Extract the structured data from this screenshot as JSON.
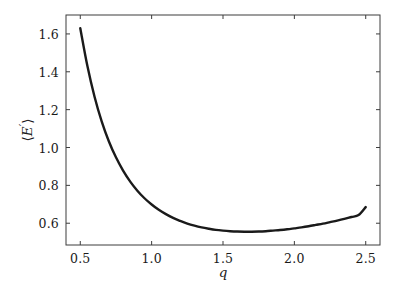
{
  "chart_data": {
    "type": "line",
    "title": "",
    "subtitle": "",
    "xlabel": "q",
    "ylabel": "⟨E′⟩",
    "ylabel_parts": {
      "open_bracket": "⟨",
      "symbol": "E",
      "prime": "′",
      "close_bracket": "⟩"
    },
    "xlim": [
      0.4,
      2.6
    ],
    "ylim": [
      0.485,
      1.7
    ],
    "xticks": [
      0.5,
      1.0,
      1.5,
      2.0,
      2.5
    ],
    "xtick_labels": [
      "0.5",
      "1.0",
      "1.5",
      "2.0",
      "2.5"
    ],
    "yticks": [
      0.6,
      0.8,
      1.0,
      1.2,
      1.4,
      1.6
    ],
    "ytick_labels": [
      "0.6",
      "0.8",
      "1.0",
      "1.2",
      "1.4",
      "1.6"
    ],
    "grid": false,
    "legend": null,
    "legend_position": "none",
    "tick_direction": "in",
    "frame": true,
    "series": [
      {
        "name": "mean-energy",
        "color": "#1a1a1a",
        "line_width": 2.4,
        "x": [
          0.5,
          0.55,
          0.6,
          0.65,
          0.7,
          0.75,
          0.8,
          0.85,
          0.9,
          0.95,
          1.0,
          1.05,
          1.1,
          1.15,
          1.2,
          1.25,
          1.3,
          1.35,
          1.4,
          1.45,
          1.5,
          1.55,
          1.6,
          1.65,
          1.7,
          1.75,
          1.8,
          1.85,
          1.9,
          1.95,
          2.0,
          2.05,
          2.1,
          2.15,
          2.2,
          2.25,
          2.3,
          2.35,
          2.4,
          2.45,
          2.5
        ],
        "y": [
          1.63,
          1.43,
          1.268,
          1.138,
          1.033,
          0.948,
          0.878,
          0.82,
          0.772,
          0.732,
          0.699,
          0.671,
          0.648,
          0.628,
          0.612,
          0.598,
          0.587,
          0.578,
          0.571,
          0.565,
          0.561,
          0.558,
          0.556,
          0.555,
          0.555,
          0.556,
          0.558,
          0.561,
          0.564,
          0.568,
          0.573,
          0.578,
          0.584,
          0.591,
          0.598,
          0.606,
          0.614,
          0.623,
          0.633,
          0.643,
          0.685
        ],
        "minimum": {
          "x": 1.67,
          "y": 0.555
        },
        "endpoints": {
          "left": {
            "x": 0.5,
            "y": 1.63
          },
          "right": {
            "x": 2.5,
            "y": 0.685
          }
        }
      }
    ]
  },
  "style": {
    "background": "#ffffff",
    "axis_color": "#3c3c3c",
    "text_color": "#1a1a1a",
    "curve_color": "#1a1a1a"
  }
}
